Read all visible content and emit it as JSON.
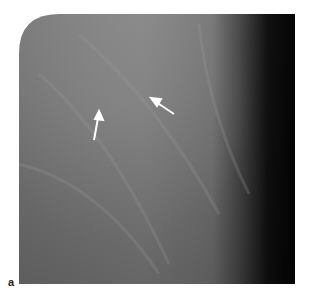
{
  "figure": {
    "panel_label": "a",
    "arrows": [
      {
        "name": "arrow-upper-right",
        "from": [
          174,
          100
        ],
        "to": [
          152,
          85
        ]
      },
      {
        "name": "arrow-lower-left",
        "from": [
          94,
          140
        ],
        "to": [
          99,
          112
        ]
      }
    ],
    "colors": {
      "tissue_light": "#8a8a8a",
      "tissue_mid": "#6e6e6e",
      "edge_dark": "#050505",
      "arrow": "#ffffff"
    }
  }
}
